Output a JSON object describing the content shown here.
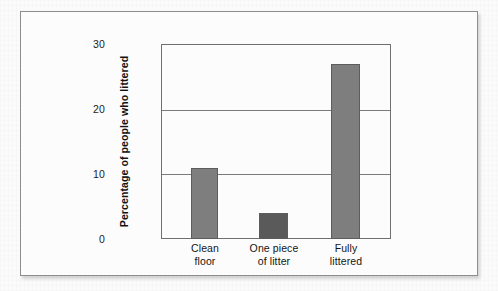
{
  "figure": {
    "frame_label": "chart-figure-frame",
    "background_color": "#fcfcfc",
    "border_color": "#8e8e8e"
  },
  "chart_data": {
    "type": "bar",
    "title": "",
    "xlabel": "",
    "ylabel": "Percentage of people who littered",
    "categories": [
      "Clean floor",
      "One piece of litter",
      "Fully littered"
    ],
    "category_lines": [
      [
        "Clean",
        "floor"
      ],
      [
        "One piece",
        "of litter"
      ],
      [
        "Fully",
        "littered"
      ]
    ],
    "values": [
      11,
      4,
      27
    ],
    "ylim": [
      0,
      30
    ],
    "yticks": [
      0,
      10,
      20,
      30
    ],
    "ytick_labels": [
      "0",
      "10",
      "20",
      "30"
    ],
    "grid": true,
    "grid_orientation": "horizontal",
    "legend": false,
    "bar_colors": [
      "#7e7e7e",
      "#5a5a5a",
      "#7e7e7e"
    ],
    "bar_border_color": "#5d5d5d",
    "axis_color": "#6f6f6f"
  }
}
